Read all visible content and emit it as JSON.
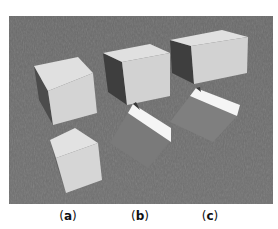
{
  "figure": {
    "colors": {
      "ground": "#6c6c6c",
      "box_light": "#d6d6d6",
      "box_top": "#e2e2e2",
      "box_dark": "#4a4a4a",
      "strip_white": "#f4f4f4",
      "tilted_face": "#7d7d7d"
    }
  },
  "panels": [
    {
      "id": "a",
      "label_open": "(",
      "label_letter": "a",
      "label_close": ")"
    },
    {
      "id": "b",
      "label_open": "(",
      "label_letter": "b",
      "label_close": ")"
    },
    {
      "id": "c",
      "label_open": "(",
      "label_letter": "c",
      "label_close": ")"
    }
  ]
}
